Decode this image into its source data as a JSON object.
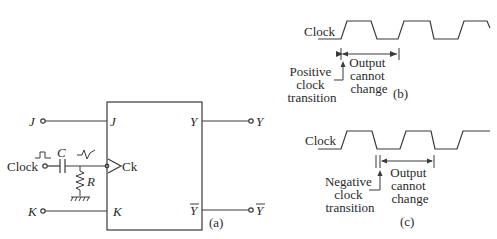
{
  "panel_a": {
    "caption": "(a)",
    "inputs": {
      "j": "J",
      "clock": "Clock",
      "k": "K"
    },
    "box_pins": {
      "j": "J",
      "ck": "Ck",
      "k": "K",
      "y": "Y",
      "y_bar": "Y"
    },
    "outputs": {
      "y": "Y",
      "y_bar": "Y"
    },
    "components": {
      "capacitor": "C",
      "resistor": "R"
    }
  },
  "panel_b": {
    "caption": "(b)",
    "clock_label": "Clock",
    "transition_label": [
      "Positive",
      "clock",
      "transition"
    ],
    "output_label": [
      "Output",
      "cannot",
      "change"
    ]
  },
  "panel_c": {
    "caption": "(c)",
    "clock_label": "Clock",
    "transition_label": [
      "Negative",
      "clock",
      "transition"
    ],
    "output_label": [
      "Output",
      "cannot",
      "change"
    ]
  }
}
